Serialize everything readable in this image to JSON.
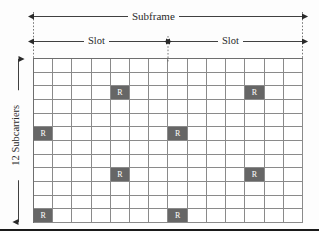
{
  "figure": {
    "subframe_label": "Subframe",
    "slot_labels": [
      "Slot",
      "Slot"
    ],
    "subcarriers_label": "12 Subcarriers",
    "reference_symbol": "R",
    "colors": {
      "reference_cell": "#666666",
      "grid_line": "#8a8a8a",
      "grid_border": "#6e6e6e",
      "guide_line": "#4a4a4a",
      "text": "#2a2a2a",
      "background": "#fdfdfd"
    }
  },
  "chart_data": {
    "type": "heatmap",
    "title": "Subframe",
    "xlabel": "",
    "ylabel": "12 Subcarriers",
    "columns": 14,
    "rows": 12,
    "x_span_labels": [
      "Slot",
      "Slot"
    ],
    "x_span_columns": [
      7,
      7
    ],
    "cell_value_empty": "",
    "cell_value_reference": "R",
    "reference_cells": [
      {
        "row": 2,
        "col": 4
      },
      {
        "row": 2,
        "col": 11
      },
      {
        "row": 5,
        "col": 0
      },
      {
        "row": 5,
        "col": 7
      },
      {
        "row": 8,
        "col": 4
      },
      {
        "row": 8,
        "col": 11
      },
      {
        "row": 11,
        "col": 0
      },
      {
        "row": 11,
        "col": 7
      }
    ],
    "grid": true,
    "legend": ""
  }
}
